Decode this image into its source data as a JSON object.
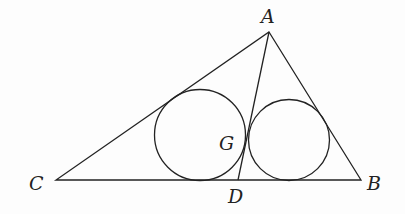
{
  "diagram": {
    "type": "geometry",
    "labels": {
      "A": "A",
      "B": "B",
      "C": "C",
      "D": "D",
      "G": "G"
    },
    "points": {
      "A": [
        269,
        32
      ],
      "B": [
        361,
        180
      ],
      "C": [
        56,
        180
      ],
      "D": [
        238,
        180
      ]
    },
    "circles": [
      {
        "name": "left-incircle",
        "cx": 200,
        "cy": 135,
        "r": 45.5
      },
      {
        "name": "right-incircle",
        "cx": 289,
        "cy": 140,
        "r": 40.5
      }
    ],
    "stroke_color": "#222222"
  }
}
